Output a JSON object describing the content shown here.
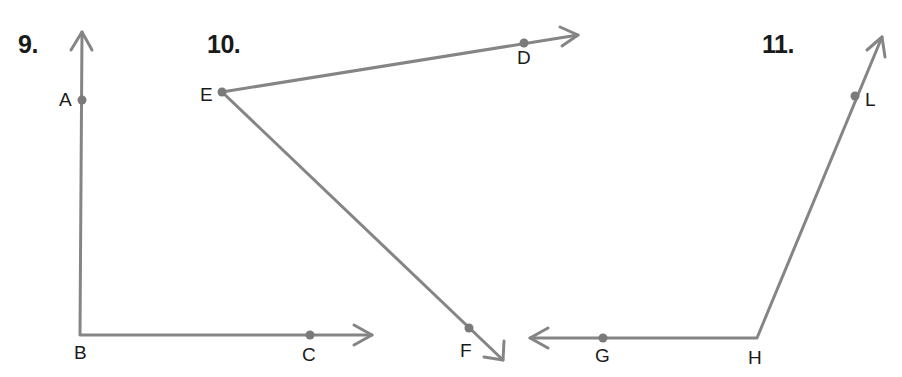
{
  "colors": {
    "ray": "#858585",
    "point": "#7a7a7a",
    "text": "#1a1a1a"
  },
  "problems": [
    {
      "number": "9.",
      "vertex": "B",
      "points": [
        {
          "label": "A",
          "x": 82,
          "y": 100
        },
        {
          "label": "B",
          "x": 80,
          "y": 335
        },
        {
          "label": "C",
          "x": 310,
          "y": 335
        }
      ],
      "rays": [
        {
          "from": "B",
          "through": "A",
          "tip": [
            82,
            32
          ]
        },
        {
          "from": "B",
          "through": "C",
          "tip": [
            372,
            335
          ]
        }
      ]
    },
    {
      "number": "10.",
      "vertex": "E",
      "points": [
        {
          "label": "D",
          "x": 524,
          "y": 43
        },
        {
          "label": "E",
          "x": 222,
          "y": 92
        },
        {
          "label": "F",
          "x": 469,
          "y": 328
        }
      ],
      "rays": [
        {
          "from": "E",
          "through": "D",
          "tip": [
            578,
            35
          ]
        },
        {
          "from": "E",
          "through": "F",
          "tip": [
            503,
            360
          ]
        }
      ]
    },
    {
      "number": "11.",
      "vertex": "H",
      "points": [
        {
          "label": "G",
          "x": 603,
          "y": 338
        },
        {
          "label": "H",
          "x": 757,
          "y": 338
        },
        {
          "label": "L",
          "x": 855,
          "y": 96
        }
      ],
      "rays": [
        {
          "from": "H",
          "through": "G",
          "tip": [
            530,
            338
          ]
        },
        {
          "from": "H",
          "through": "L",
          "tip": [
            882,
            37
          ]
        }
      ]
    }
  ],
  "labels": {
    "p9": "9.",
    "p10": "10.",
    "p11": "11.",
    "A": "A",
    "B": "B",
    "C": "C",
    "D": "D",
    "E": "E",
    "F": "F",
    "G": "G",
    "H": "H",
    "L": "L"
  }
}
